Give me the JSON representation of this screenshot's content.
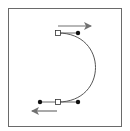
{
  "diagram": {
    "type": "bezier-path-illustration",
    "colors": {
      "frame": "#6a6a6a",
      "curve": "#555555",
      "arrow": "#707070",
      "anchor_fill": "#ffffff",
      "anchor_stroke": "#333333",
      "handle": "#111111"
    },
    "curve": {
      "start": [
        58,
        33
      ],
      "control1": [
        108,
        33
      ],
      "control2": [
        108,
        102
      ],
      "end": [
        58,
        102
      ]
    },
    "anchors": [
      {
        "name": "top-anchor",
        "x": 58,
        "y": 33
      },
      {
        "name": "bottom-anchor",
        "x": 58,
        "y": 102
      }
    ],
    "handles": [
      {
        "name": "top-handle",
        "x": 78,
        "y": 33,
        "from": [
          58,
          33
        ]
      },
      {
        "name": "bottom-handle-right",
        "x": 78,
        "y": 102,
        "from": [
          58,
          102
        ]
      },
      {
        "name": "bottom-handle-left",
        "x": 40,
        "y": 102,
        "from": [
          58,
          102
        ]
      }
    ],
    "arrows": [
      {
        "name": "top-arrow-right",
        "x1": 58,
        "y1": 26,
        "x2": 91,
        "y2": 26,
        "direction": "right"
      },
      {
        "name": "bottom-arrow-left",
        "x1": 57,
        "y1": 111,
        "x2": 32,
        "y2": 111,
        "direction": "left"
      }
    ]
  }
}
